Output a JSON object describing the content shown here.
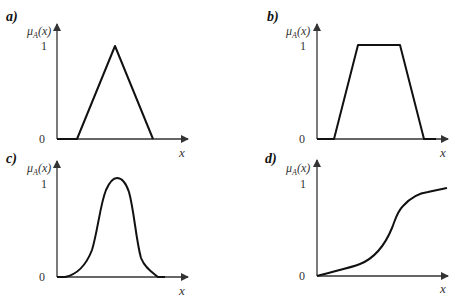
{
  "figure": {
    "panels": [
      {
        "id": "a",
        "label": "a)",
        "shape": "triangular",
        "y_axis_label_mu": "μ",
        "y_axis_label_sub": "A",
        "y_axis_label_arg": "(x)",
        "tick_one": "1",
        "tick_zero": "0",
        "x_axis_label": "x"
      },
      {
        "id": "b",
        "label": "b)",
        "shape": "trapezoidal",
        "y_axis_label_mu": "μ",
        "y_axis_label_sub": "A",
        "y_axis_label_arg": "(x)",
        "tick_one": "1",
        "tick_zero": "0",
        "x_axis_label": "x"
      },
      {
        "id": "c",
        "label": "c)",
        "shape": "gaussian",
        "y_axis_label_mu": "μ",
        "y_axis_label_sub": "A",
        "y_axis_label_arg": "(x)",
        "tick_one": "1",
        "tick_zero": "0",
        "x_axis_label": "x"
      },
      {
        "id": "d",
        "label": "d)",
        "shape": "sigmoidal",
        "y_axis_label_mu": "μ",
        "y_axis_label_sub": "A",
        "y_axis_label_arg": "(x)",
        "tick_one": "1",
        "tick_zero": "0",
        "x_axis_label": "x"
      }
    ]
  },
  "colors": {
    "line": "#111111",
    "axis": "#333333",
    "background": "#ffffff"
  }
}
